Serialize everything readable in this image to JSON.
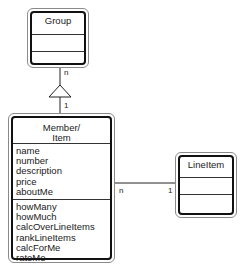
{
  "classes": {
    "group": {
      "name": "Group",
      "attributes": [],
      "operations": []
    },
    "member": {
      "name_line1": "Member/",
      "name_line2": "Item",
      "attributes": [
        "name",
        "number",
        "description",
        "price",
        "aboutMe"
      ],
      "operations": [
        "howMany",
        "howMuch",
        "calcOverLineItems",
        "rankLineItems",
        "calcForMe",
        "rateMe"
      ]
    },
    "lineitem": {
      "name": "LineItem",
      "attributes": [],
      "operations": []
    }
  },
  "relations": {
    "group_member": {
      "type": "aggregation-triangle",
      "group_end": "n",
      "member_end": "1"
    },
    "member_lineitem": {
      "type": "association",
      "member_end": "n",
      "lineitem_end": "1"
    }
  }
}
